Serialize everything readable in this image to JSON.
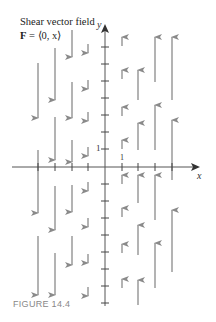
{
  "figure": {
    "title": "Shear vector field",
    "formula_bold": "F",
    "formula_rest": " = ⟨0, x⟩",
    "caption": "FIGURE 14.4",
    "x_axis_label": "x",
    "y_axis_label": "y",
    "x_tick_label": "1",
    "y_tick_label": "1"
  },
  "colors": {
    "axis": "#555555",
    "arrow": "#8a8a8a",
    "text": "#222222",
    "caption": "#888888"
  },
  "chart_data": {
    "type": "vector_field",
    "xlabel": "x",
    "ylabel": "y",
    "origin_px": [
      105,
      167
    ],
    "columns_x_px": [
      38,
      55,
      72,
      88,
      122,
      138,
      155,
      172
    ],
    "arrows": [
      {
        "x": 38,
        "y1": 63,
        "y2": 118
      },
      {
        "x": 38,
        "y1": 150,
        "y2": 213
      },
      {
        "x": 38,
        "y1": 236,
        "y2": 295
      },
      {
        "x": 55,
        "y1": 48,
        "y2": 100
      },
      {
        "x": 55,
        "y1": 117,
        "y2": 160
      },
      {
        "x": 55,
        "y1": 186,
        "y2": 230
      },
      {
        "x": 55,
        "y1": 253,
        "y2": 295
      },
      {
        "x": 72,
        "y1": 30,
        "y2": 57
      },
      {
        "x": 72,
        "y1": 82,
        "y2": 118
      },
      {
        "x": 72,
        "y1": 140,
        "y2": 162
      },
      {
        "x": 72,
        "y1": 185,
        "y2": 212
      },
      {
        "x": 72,
        "y1": 236,
        "y2": 265
      },
      {
        "x": 88,
        "y1": 44,
        "y2": 53
      },
      {
        "x": 88,
        "y1": 80,
        "y2": 89
      },
      {
        "x": 88,
        "y1": 112,
        "y2": 121
      },
      {
        "x": 88,
        "y1": 147,
        "y2": 156
      },
      {
        "x": 88,
        "y1": 182,
        "y2": 191
      },
      {
        "x": 88,
        "y1": 218,
        "y2": 227
      },
      {
        "x": 88,
        "y1": 254,
        "y2": 263
      },
      {
        "x": 88,
        "y1": 287,
        "y2": 296
      },
      {
        "x": 122,
        "y1": 46,
        "y2": 37
      },
      {
        "x": 122,
        "y1": 79,
        "y2": 70
      },
      {
        "x": 122,
        "y1": 116,
        "y2": 107
      },
      {
        "x": 122,
        "y1": 149,
        "y2": 140
      },
      {
        "x": 122,
        "y1": 184,
        "y2": 175
      },
      {
        "x": 122,
        "y1": 217,
        "y2": 208
      },
      {
        "x": 122,
        "y1": 253,
        "y2": 244
      },
      {
        "x": 122,
        "y1": 288,
        "y2": 279
      },
      {
        "x": 138,
        "y1": 100,
        "y2": 70
      },
      {
        "x": 138,
        "y1": 150,
        "y2": 123
      },
      {
        "x": 138,
        "y1": 203,
        "y2": 175
      },
      {
        "x": 138,
        "y1": 255,
        "y2": 225
      },
      {
        "x": 138,
        "y1": 305,
        "y2": 280
      },
      {
        "x": 155,
        "y1": 82,
        "y2": 37
      },
      {
        "x": 155,
        "y1": 150,
        "y2": 105
      },
      {
        "x": 155,
        "y1": 220,
        "y2": 175
      },
      {
        "x": 155,
        "y1": 288,
        "y2": 243
      },
      {
        "x": 172,
        "y1": 100,
        "y2": 37
      },
      {
        "x": 172,
        "y1": 180,
        "y2": 120
      },
      {
        "x": 172,
        "y1": 272,
        "y2": 210
      }
    ],
    "y_ticks_px": [
      47,
      64,
      81,
      98,
      115,
      132,
      149,
      184,
      201,
      218,
      235,
      252,
      269,
      286,
      303
    ],
    "x_ticks_px": [
      38,
      55,
      72,
      88,
      122,
      138,
      155,
      172
    ]
  }
}
